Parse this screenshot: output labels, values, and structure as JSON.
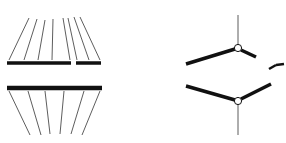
{
  "diagram": {
    "colors": {
      "background": "#ffffff",
      "stroke": "#111111",
      "thin_stroke": "#333333"
    },
    "left_panel": {
      "upper_bar_segments": [
        [
          7,
          63,
          71,
          63
        ],
        [
          76,
          63,
          101,
          63
        ]
      ],
      "upper_lines": [
        [
          9,
          60,
          29,
          18
        ],
        [
          24,
          60,
          37,
          19
        ],
        [
          38,
          60,
          45,
          20
        ],
        [
          52,
          60,
          53,
          19
        ],
        [
          70,
          60,
          63,
          18
        ],
        [
          77,
          60,
          68,
          18
        ],
        [
          89,
          60,
          74,
          17
        ],
        [
          100,
          60,
          80,
          17
        ]
      ],
      "lower_bar": [
        7,
        88,
        102,
        88
      ],
      "lower_lines": [
        [
          9,
          91,
          30,
          135
        ],
        [
          28,
          91,
          41,
          135
        ],
        [
          45,
          91,
          50,
          134
        ],
        [
          64,
          91,
          60,
          134
        ],
        [
          84,
          91,
          71,
          134
        ],
        [
          100,
          91,
          82,
          135
        ]
      ]
    },
    "right_panel": {
      "upper_molecule": {
        "stem": [
          238,
          15,
          238,
          44
        ],
        "joint": [
          238,
          48
        ],
        "arm_left": [
          186,
          64,
          235,
          49
        ],
        "arm_right": [
          241,
          50,
          256,
          57
        ]
      },
      "lower_molecule": {
        "joint": [
          238,
          101
        ],
        "arm_left": [
          186,
          86,
          235,
          100
        ],
        "arm_right": [
          241,
          99,
          271,
          84
        ],
        "stem": [
          238,
          105,
          238,
          135
        ]
      },
      "arrow_mark": [
        [
          269,
          69,
          276,
          65
        ],
        [
          276,
          65,
          284,
          64
        ]
      ]
    }
  }
}
